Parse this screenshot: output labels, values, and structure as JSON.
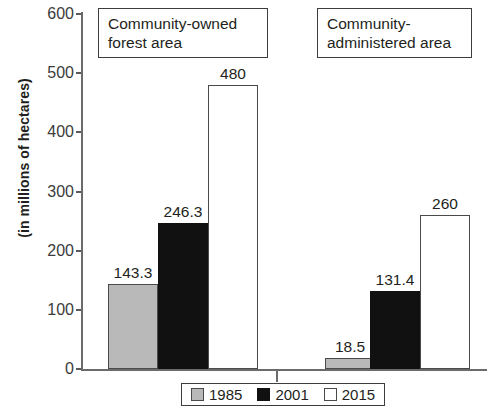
{
  "chart_data": {
    "type": "bar",
    "title": "",
    "xlabel": "",
    "ylabel": "(in millions of hectares)",
    "ylim": [
      0,
      600
    ],
    "yticks": [
      600,
      500,
      400,
      300,
      200,
      100,
      0
    ],
    "grid": false,
    "legend_position": "bottom-center",
    "categories": [
      "Community-owned forest area",
      "Community-administered area"
    ],
    "series": [
      {
        "name": "1985",
        "color": "#b9b9b9",
        "values": [
          143.3,
          18.5
        ],
        "labels": [
          "143.3",
          "18.5"
        ]
      },
      {
        "name": "2001",
        "color": "#111111",
        "values": [
          246.3,
          131.4
        ],
        "labels": [
          "246.3",
          "131.4"
        ]
      },
      {
        "name": "2015",
        "color": "#ffffff",
        "values": [
          480,
          260
        ],
        "labels": [
          "480",
          "260"
        ]
      }
    ]
  },
  "groups": [
    {
      "title_line1": "Community-owned",
      "title_line2": "forest area"
    },
    {
      "title_line1": "Community-",
      "title_line2": "administered area"
    }
  ],
  "legend": {
    "items": [
      {
        "label": "1985",
        "swatch": "gray"
      },
      {
        "label": "2001",
        "swatch": "black"
      },
      {
        "label": "2015",
        "swatch": "white"
      }
    ]
  }
}
